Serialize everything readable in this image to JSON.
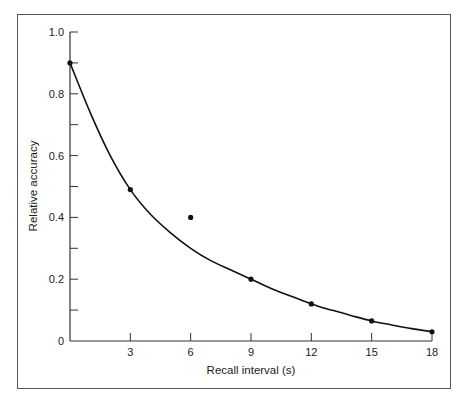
{
  "chart_data": {
    "type": "scatter",
    "title": "",
    "xlabel": "Recall interval (s)",
    "ylabel": "Relative accuracy",
    "xlim": [
      0,
      18
    ],
    "ylim": [
      0,
      1.0
    ],
    "x_ticks": [
      3,
      6,
      9,
      12,
      15,
      18
    ],
    "y_ticks": [
      0,
      0.2,
      0.4,
      0.6,
      0.8,
      1.0
    ],
    "y_tick_labels": [
      "0",
      "0.2",
      "0.4",
      "0.6",
      "0.8",
      "1.0"
    ],
    "y_minor_ticks": [
      0.1,
      0.3,
      0.5,
      0.7,
      0.9
    ],
    "grid": false,
    "legend": null,
    "series": [
      {
        "name": "Observed",
        "type": "scatter",
        "x": [
          0,
          3,
          6,
          9,
          12,
          15,
          18
        ],
        "y": [
          0.9,
          0.49,
          0.4,
          0.2,
          0.12,
          0.065,
          0.03
        ]
      },
      {
        "name": "Fitted curve",
        "type": "line",
        "description": "smooth decaying curve through points (excluding outlier at 6 s)",
        "x": [
          0,
          1,
          2,
          3,
          4,
          5,
          6,
          7,
          8,
          9,
          10,
          11,
          12,
          13,
          14,
          15,
          16,
          17,
          18
        ],
        "y": [
          0.9,
          0.74,
          0.6,
          0.49,
          0.41,
          0.35,
          0.3,
          0.26,
          0.23,
          0.2,
          0.17,
          0.145,
          0.12,
          0.1,
          0.082,
          0.065,
          0.052,
          0.04,
          0.03
        ]
      }
    ]
  }
}
